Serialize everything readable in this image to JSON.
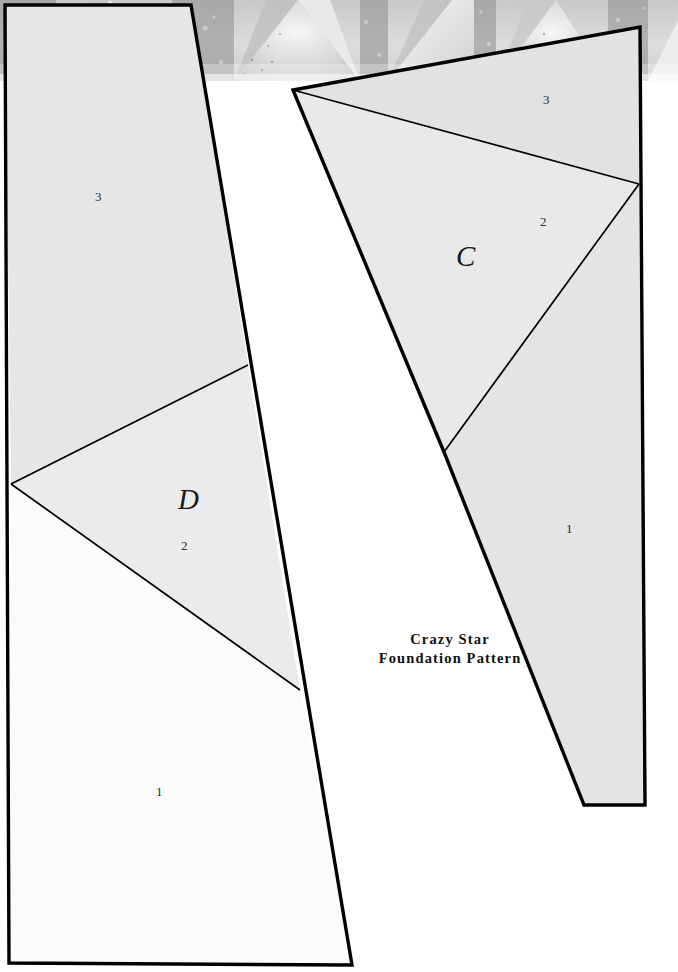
{
  "document": {
    "title_line1": "Crazy Star",
    "title_line2": "Foundation Pattern",
    "page_width": 678,
    "page_height": 972,
    "background_color": "#ffffff"
  },
  "photo_band": {
    "name": "quilt-photograph-strip",
    "description": "black-and-white photo of a pieced star quilt",
    "height": 81,
    "base_color": "#d8d8d8",
    "highlight_color": "#f2f2f2",
    "shadow_color": "#9a9a9a"
  },
  "colors": {
    "outline": "#000000",
    "divider": "#000000",
    "fill_region_1": "#fbfbfb",
    "fill_region_2": "#ebebeb",
    "fill_region_3": "#e6e6e6",
    "fill_region_c1": "#e4e4e4",
    "fill_region_c2": "#e9e9e9",
    "fill_region_c3": "#e2e2e2",
    "label_color": "#1a1a1a"
  },
  "patterns": [
    {
      "id": "pattern-D",
      "letter": "D",
      "outline_points": "5,5 191,5 352,965 9,963",
      "outline_width": 3.2,
      "regions": [
        {
          "number": "3",
          "label": "3",
          "points": "5,5 191,5 248,365 11,484",
          "fill": "#e6e6e6",
          "label_x": 99,
          "label_y": 197
        },
        {
          "number": "2",
          "label": "2",
          "points": "11,484 248,365 300,690",
          "fill": "#ebebeb",
          "label_x": 186,
          "label_y": 547
        },
        {
          "number": "1",
          "label": "1",
          "points": "11,484 300,690 352,965 9,963",
          "fill": "#fbfbfb",
          "label_x": 160,
          "label_y": 793
        }
      ],
      "dividers": [
        "11,484 248,365",
        "11,484 300,690"
      ]
    },
    {
      "id": "pattern-C",
      "letter": "C",
      "outline_points": "293,90 640,27 645,805 584,805 444,452",
      "outline_width": 3.2,
      "regions": [
        {
          "number": "3",
          "label": "3",
          "points": "293,90 640,27 639,184",
          "fill": "#e2e2e2",
          "label_x": 548,
          "label_y": 100
        },
        {
          "number": "2",
          "label": "2",
          "points": "293,90 639,184 444,452",
          "fill": "#e9e9e9",
          "label_x": 545,
          "label_y": 222
        },
        {
          "number": "1",
          "label": "1",
          "points": "444,452 639,184 645,805 584,805",
          "fill": "#e4e4e4",
          "label_x": 570,
          "label_y": 529
        }
      ],
      "dividers": [
        "293,90 639,184",
        "639,184 444,452"
      ]
    }
  ]
}
